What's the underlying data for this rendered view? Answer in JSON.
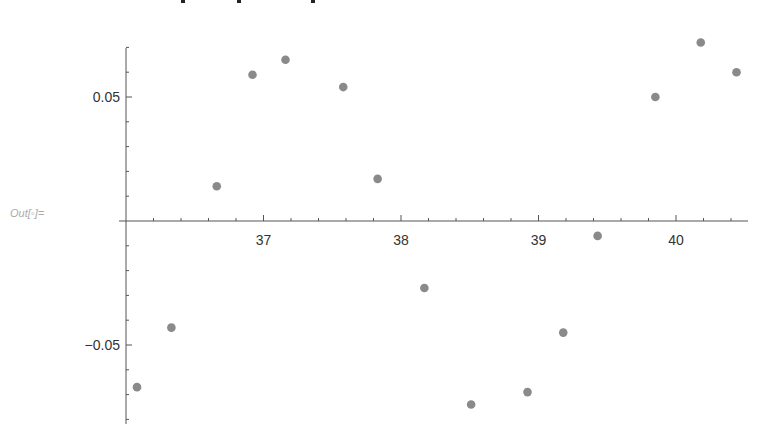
{
  "cell": {
    "out_label": "Out[◦]="
  },
  "chart_data": {
    "type": "scatter",
    "title": "",
    "xlabel": "",
    "ylabel": "",
    "xlim": [
      36.0,
      40.5
    ],
    "ylim": [
      -0.08,
      0.07
    ],
    "axes_origin": [
      36.0,
      0
    ],
    "grid": false,
    "legend": null,
    "x_ticks": [
      37,
      38,
      39,
      40
    ],
    "x_tick_labels": [
      "37",
      "38",
      "39",
      "40"
    ],
    "y_ticks": [
      -0.05,
      0.05
    ],
    "y_tick_labels": [
      "−0.05",
      "0.05"
    ],
    "point_color": "#8a8a8a",
    "x": [
      36.08,
      36.33,
      36.66,
      36.92,
      37.16,
      37.58,
      37.83,
      38.17,
      38.51,
      38.92,
      39.18,
      39.43,
      39.85,
      40.18,
      40.44
    ],
    "y": [
      -0.067,
      -0.043,
      0.014,
      0.059,
      0.065,
      0.054,
      0.017,
      -0.027,
      -0.074,
      -0.069,
      -0.045,
      -0.006,
      0.05,
      0.072,
      0.06
    ]
  }
}
